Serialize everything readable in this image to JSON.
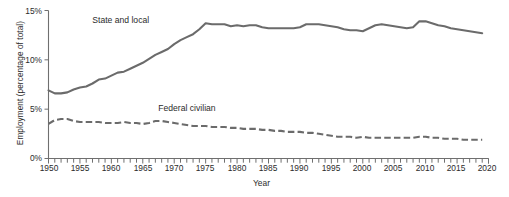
{
  "chart_data": {
    "type": "line",
    "title": "",
    "xlabel": "Year",
    "ylabel": "Employment (percentage of total)",
    "xlim": [
      1950,
      2020
    ],
    "ylim": [
      0,
      15
    ],
    "grid": false,
    "legend_position": "inline-annotation",
    "y_tick_labels": [
      "0%",
      "5%",
      "10%",
      "15%"
    ],
    "y_tick_values": [
      0,
      5,
      10,
      15
    ],
    "x_tick_labels": [
      "1950",
      "1955",
      "1960",
      "1965",
      "1970",
      "1975",
      "1980",
      "1985",
      "1990",
      "1995",
      "2000",
      "2005",
      "2010",
      "2015",
      "2020"
    ],
    "x_tick_values": [
      1950,
      1955,
      1960,
      1965,
      1970,
      1975,
      1980,
      1985,
      1990,
      1995,
      2000,
      2005,
      2010,
      2015,
      2020
    ],
    "x_minor_tick_step": 1,
    "series_color": "#6b6b6b",
    "x": [
      1950,
      1951,
      1952,
      1953,
      1954,
      1955,
      1956,
      1957,
      1958,
      1959,
      1960,
      1961,
      1962,
      1963,
      1964,
      1965,
      1966,
      1967,
      1968,
      1969,
      1970,
      1971,
      1972,
      1973,
      1974,
      1975,
      1976,
      1977,
      1978,
      1979,
      1980,
      1981,
      1982,
      1983,
      1984,
      1985,
      1986,
      1987,
      1988,
      1989,
      1990,
      1991,
      1992,
      1993,
      1994,
      1995,
      1996,
      1997,
      1998,
      1999,
      2000,
      2001,
      2002,
      2003,
      2004,
      2005,
      2006,
      2007,
      2008,
      2009,
      2010,
      2011,
      2012,
      2013,
      2014,
      2015,
      2016,
      2017,
      2018,
      2019
    ],
    "series": [
      {
        "name": "State and local",
        "style": "solid",
        "label": "State and local",
        "values": [
          6.9,
          6.6,
          6.6,
          6.7,
          7.0,
          7.2,
          7.3,
          7.6,
          8.0,
          8.1,
          8.4,
          8.7,
          8.8,
          9.1,
          9.4,
          9.7,
          10.1,
          10.5,
          10.8,
          11.1,
          11.6,
          12.0,
          12.3,
          12.6,
          13.1,
          13.7,
          13.6,
          13.6,
          13.6,
          13.4,
          13.5,
          13.4,
          13.5,
          13.5,
          13.3,
          13.2,
          13.2,
          13.2,
          13.2,
          13.2,
          13.3,
          13.6,
          13.6,
          13.6,
          13.5,
          13.4,
          13.3,
          13.1,
          13.0,
          13.0,
          12.9,
          13.2,
          13.5,
          13.6,
          13.5,
          13.4,
          13.3,
          13.2,
          13.3,
          13.9,
          13.9,
          13.7,
          13.5,
          13.4,
          13.2,
          13.1,
          13.0,
          12.9,
          12.8,
          12.7
        ]
      },
      {
        "name": "Federal civilian",
        "style": "dashed",
        "label": "Federal civilian",
        "values": [
          3.5,
          3.9,
          4.0,
          4.0,
          3.8,
          3.7,
          3.7,
          3.7,
          3.7,
          3.6,
          3.6,
          3.6,
          3.7,
          3.6,
          3.6,
          3.5,
          3.6,
          3.8,
          3.8,
          3.7,
          3.6,
          3.5,
          3.4,
          3.3,
          3.3,
          3.3,
          3.2,
          3.2,
          3.2,
          3.1,
          3.1,
          3.0,
          3.0,
          3.0,
          2.9,
          2.9,
          2.8,
          2.8,
          2.7,
          2.7,
          2.7,
          2.6,
          2.6,
          2.5,
          2.4,
          2.3,
          2.2,
          2.2,
          2.2,
          2.1,
          2.2,
          2.1,
          2.1,
          2.1,
          2.1,
          2.1,
          2.1,
          2.1,
          2.1,
          2.2,
          2.2,
          2.1,
          2.1,
          2.0,
          2.0,
          2.0,
          1.9,
          1.9,
          1.9,
          1.9
        ]
      }
    ],
    "annotations": [
      {
        "text": "State and local",
        "x": 1961.5,
        "y": 13.9
      },
      {
        "text": "Federal civilian",
        "x": 1972.0,
        "y": 5.0
      }
    ]
  }
}
